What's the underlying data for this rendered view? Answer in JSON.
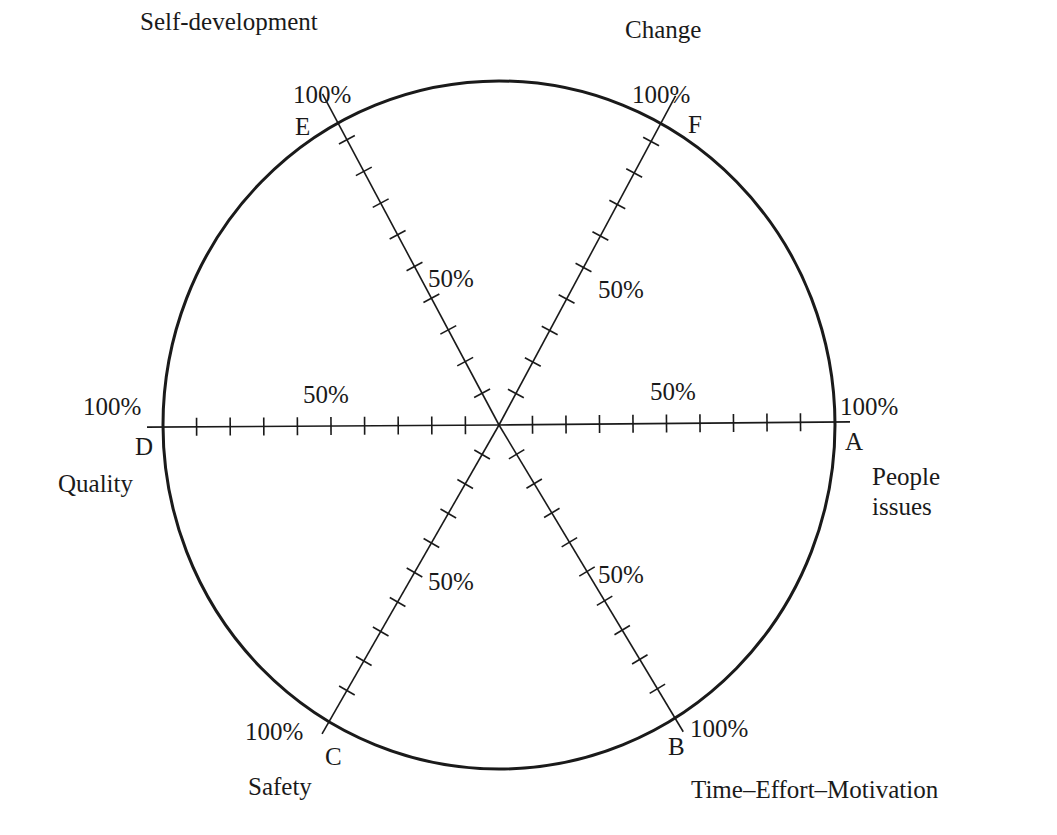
{
  "diagram": {
    "type": "radar-wheel",
    "center": [
      499,
      425
    ],
    "radius_x": 336,
    "radius_y": 344,
    "tick_count": 9,
    "tick_step_percent": 10,
    "colors": {
      "stroke": "#1a1a1a",
      "background": "#ffffff"
    },
    "axes": [
      {
        "id": "A",
        "name": "People issues",
        "name_lines": [
          "People",
          "issues"
        ],
        "end": [
          834,
          422
        ],
        "letter_pos": [
          845,
          450
        ],
        "max_pos": [
          840,
          415
        ],
        "mid_label": "50%",
        "mid_pos": [
          650,
          400
        ],
        "max_label": "100%",
        "name_pos": [
          872,
          485
        ],
        "name_anchor": "start"
      },
      {
        "id": "B",
        "name": "Time–Effort–Motivation",
        "name_lines": [
          "Time–Effort–Motivation"
        ],
        "end": [
          675,
          718
        ],
        "letter_pos": [
          668,
          755
        ],
        "max_pos": [
          690,
          737
        ],
        "mid_label": "50%",
        "mid_pos": [
          598,
          583
        ],
        "max_label": "100%",
        "name_pos": [
          691,
          798
        ],
        "name_anchor": "start"
      },
      {
        "id": "C",
        "name": "Safety",
        "name_lines": [
          "Safety"
        ],
        "end": [
          330,
          720
        ],
        "letter_pos": [
          325,
          765
        ],
        "max_pos": [
          245,
          740
        ],
        "mid_label": "50%",
        "mid_pos": [
          428,
          590
        ],
        "max_label": "100%",
        "name_pos": [
          248,
          795
        ],
        "name_anchor": "start"
      },
      {
        "id": "D",
        "name": "Quality",
        "name_lines": [
          "Quality"
        ],
        "end": [
          163,
          427
        ],
        "letter_pos": [
          135,
          455
        ],
        "max_pos": [
          83,
          415
        ],
        "mid_label": "50%",
        "mid_pos": [
          303,
          403
        ],
        "max_label": "100%",
        "name_pos": [
          58,
          492
        ],
        "name_anchor": "start"
      },
      {
        "id": "E",
        "name": "Self-development",
        "name_lines": [
          "Self-development"
        ],
        "end": [
          330,
          108
        ],
        "letter_pos": [
          295,
          135
        ],
        "max_pos": [
          293,
          103
        ],
        "mid_label": "50%",
        "mid_pos": [
          428,
          287
        ],
        "max_label": "100%",
        "name_pos": [
          140,
          30
        ],
        "name_anchor": "start"
      },
      {
        "id": "F",
        "name": "Change",
        "name_lines": [
          "Change"
        ],
        "end": [
          668,
          110
        ],
        "letter_pos": [
          688,
          133
        ],
        "max_pos": [
          632,
          103
        ],
        "mid_label": "50%",
        "mid_pos": [
          598,
          298
        ],
        "max_label": "100%",
        "name_pos": [
          625,
          38
        ],
        "name_anchor": "start"
      }
    ]
  }
}
